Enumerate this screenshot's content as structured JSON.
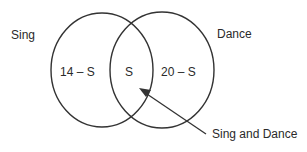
{
  "diagram": {
    "type": "venn",
    "sets": [
      {
        "name": "Sing",
        "only_region_label": "14 – S"
      },
      {
        "name": "Dance",
        "only_region_label": "20 – S"
      }
    ],
    "intersection_label": "S",
    "callout_label": "Sing and Dance"
  }
}
